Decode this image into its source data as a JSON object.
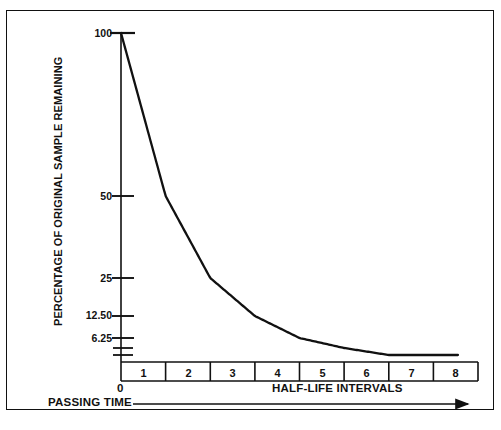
{
  "chart_data": {
    "type": "line",
    "title": "",
    "subtitle": "",
    "ylabel": "PERCENTAGE OF ORIGINAL SAMPLE REMAINING",
    "xlabel": "HALF-LIFE INTERVALS",
    "secondary_xlabel": "PASSING TIME",
    "x": [
      0,
      1,
      2,
      3,
      4,
      5,
      6,
      7,
      7.5
    ],
    "values": [
      100,
      50,
      25,
      12.5,
      6.25,
      3.125,
      1.5625,
      0.78125,
      0.55
    ],
    "y_tick_labels": [
      "100",
      "50",
      "25",
      "12.50",
      "6.25",
      "",
      ""
    ],
    "y_tick_values": [
      100,
      50,
      25,
      12.5,
      6.25,
      3.125,
      1.5625
    ],
    "x_tick_labels": [
      "1",
      "2",
      "3",
      "4",
      "5",
      "6",
      "7",
      "8"
    ],
    "x_origin_label": "0",
    "xlim": [
      0,
      8
    ],
    "ylim_log": [
      100,
      1.5625
    ],
    "yscale": "log2-halving",
    "grid": false,
    "legend": null,
    "line_color": "#111111",
    "axis_color": "#111111",
    "background": "#ffffff"
  },
  "axes": {
    "y_title": "PERCENTAGE OF ORIGINAL SAMPLE REMAINING",
    "x_title": "HALF-LIFE INTERVALS",
    "time_arrow_label": "PASSING TIME",
    "origin": "0"
  },
  "caption": {
    "cut_off_text": ""
  },
  "colors": {
    "ink": "#111111",
    "paper": "#ffffff"
  }
}
